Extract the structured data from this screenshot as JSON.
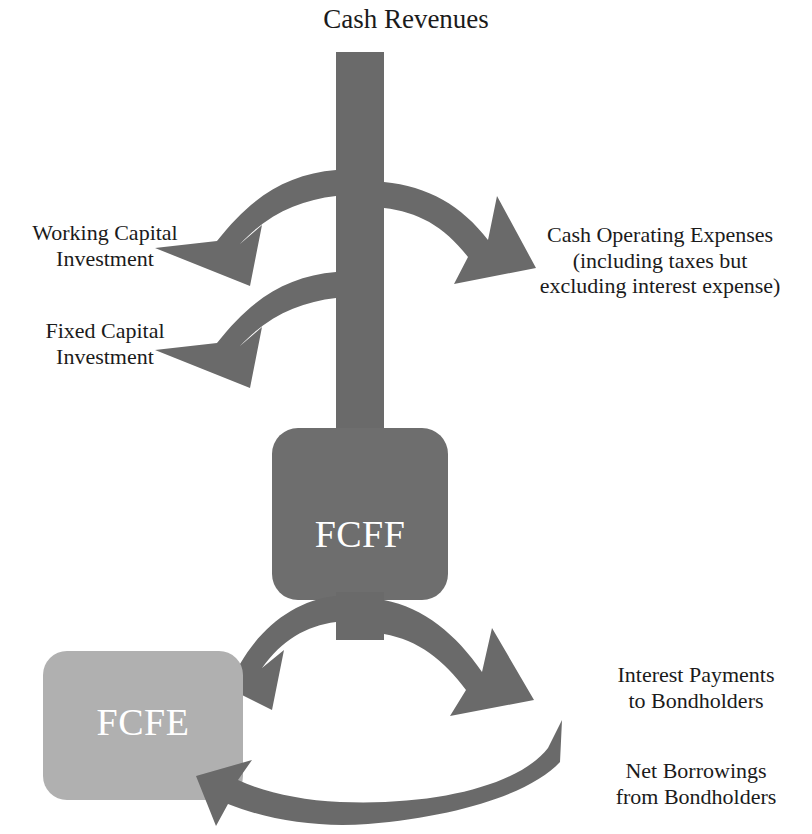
{
  "diagram": {
    "colors": {
      "arrow": "#6a6a6a",
      "fcff_box": "#6e6e6e",
      "fcfe_box": "#b0b0b0",
      "text_dark": "#1b1b1b",
      "node_text": "#ffffff",
      "background": "#ffffff"
    },
    "source_label": "Cash Revenues",
    "nodes": [
      {
        "id": "fcff",
        "label": "FCFF",
        "shape": "rounded-rect",
        "fill": "#6e6e6e"
      },
      {
        "id": "fcfe",
        "label": "FCFE",
        "shape": "rounded-rect",
        "fill": "#b0b0b0"
      }
    ],
    "outflows_left": [
      "Working Capital\nInvestment",
      "Fixed Capital\nInvestment"
    ],
    "outflows_right": [
      "Cash Operating Expenses\n(including taxes but\nexcluding interest expense)",
      "Interest Payments\nto Bondholders"
    ],
    "inflows": [
      "Net Borrowings\nfrom Bondholders"
    ],
    "labels": {
      "cash_revenues": "Cash Revenues",
      "working_capital_investment": "Working Capital\nInvestment",
      "fixed_capital_investment": "Fixed Capital\nInvestment",
      "cash_operating_expenses": "Cash Operating Expenses\n(including taxes but\nexcluding interest expense)",
      "interest_payments": "Interest Payments\nto Bondholders",
      "net_borrowings": "Net Borrowings\nfrom Bondholders",
      "fcff": "FCFF",
      "fcfe": "FCFE"
    }
  }
}
